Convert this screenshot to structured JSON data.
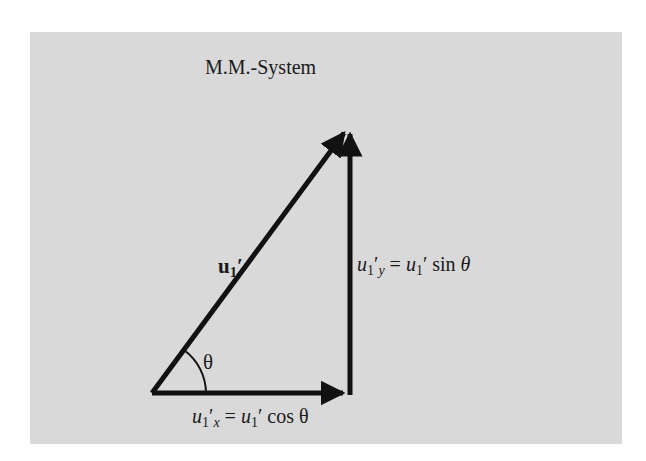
{
  "title": "M.M.-System",
  "colors": {
    "panel_background": "#d9d9d9",
    "stroke": "#111111",
    "text": "#1a1a1a"
  },
  "vectors": {
    "resultant": {
      "label_symbol": "u",
      "label_sub": "1",
      "label_prime": "′",
      "from": [
        152,
        393
      ],
      "to": [
        349,
        127
      ]
    },
    "x_component": {
      "from": [
        152,
        393
      ],
      "to": [
        350,
        393
      ]
    },
    "y_component": {
      "from": [
        350,
        393
      ],
      "to": [
        350,
        127
      ]
    }
  },
  "angle": {
    "symbol": "θ"
  },
  "equations": {
    "y_component": {
      "lhs_var": "u",
      "lhs_sub": "1",
      "lhs_prime": "′",
      "lhs_axis": "y",
      "equals": " = ",
      "rhs_var": "u",
      "rhs_sub": "1",
      "rhs_prime": "′",
      "rhs_func": " sin ",
      "rhs_angle": "θ"
    },
    "x_component": {
      "lhs_var": "u",
      "lhs_sub": "1",
      "lhs_prime": "′",
      "lhs_axis": "x",
      "equals": " = ",
      "rhs_var": "u",
      "rhs_sub": "1",
      "rhs_prime": "′",
      "rhs_func": " cos ",
      "rhs_angle": "θ"
    }
  }
}
